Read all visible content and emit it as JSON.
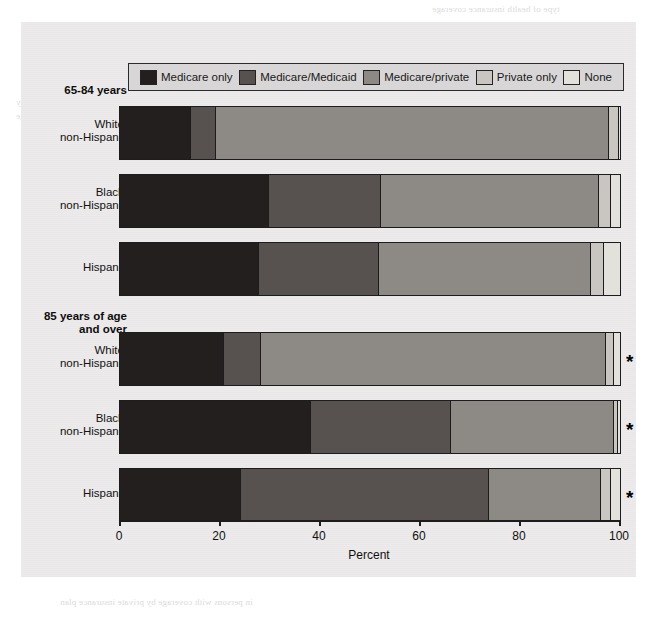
{
  "figure": {
    "axis_title": "Percent",
    "x_ticks": [
      0,
      20,
      40,
      60,
      80,
      100
    ],
    "x_min": 0,
    "x_max": 100,
    "footnote_marker": "*"
  },
  "legend": {
    "items": [
      {
        "label": "Medicare only",
        "color": "#231f1f"
      },
      {
        "label": "Medicare/Medicaid",
        "color": "#57524f"
      },
      {
        "label": "Medicare/private",
        "color": "#8d8a85"
      },
      {
        "label": "Private only",
        "color": "#c9c6c1"
      },
      {
        "label": "None",
        "color": "#e3e1dc"
      }
    ]
  },
  "groups": [
    {
      "title": "65-84 years",
      "rows": [
        {
          "label": "White,\nnon-Hispanic",
          "marker": ""
        },
        {
          "label": "Black,\nnon-Hispanic",
          "marker": ""
        },
        {
          "label": "Hispanic",
          "marker": ""
        }
      ]
    },
    {
      "title": "85 years of age\nand over",
      "rows": [
        {
          "label": "White,\nnon-Hispanic",
          "marker": "*"
        },
        {
          "label": "Black,\nnon-Hispanic",
          "marker": "*"
        },
        {
          "label": "Hispanic",
          "marker": "*"
        }
      ]
    }
  ],
  "ghost_text": [
    {
      "x": 432,
      "y": 3,
      "text": "type of health insurance coverage"
    },
    {
      "x": 470,
      "y": 28,
      "text": "Americans Medicare beneficiaries"
    },
    {
      "x": 440,
      "y": 40,
      "text": "65 Health care for the elderly insurance"
    },
    {
      "x": 170,
      "y": 28,
      "text": "Enrollment in Medicare HMO's increases"
    },
    {
      "x": 150,
      "y": 40,
      "text": "distributed throughout the country. The HMO COVID"
    },
    {
      "x": 16,
      "y": 96,
      "text": "Medicare program, they"
    },
    {
      "x": 16,
      "y": 110,
      "text": "coverage"
    },
    {
      "x": 22,
      "y": 136,
      "text": "in persons"
    },
    {
      "x": 430,
      "y": 200,
      "text": "coverage of the elderly"
    },
    {
      "x": 430,
      "y": 224,
      "text": "and 19 percent of"
    },
    {
      "x": 428,
      "y": 296,
      "text": "Medicare HMO, were"
    },
    {
      "x": 436,
      "y": 332,
      "text": "hospital insurance and"
    },
    {
      "x": 430,
      "y": 356,
      "text": "the aged and disabled"
    },
    {
      "x": 432,
      "y": 500,
      "text": "the beneficiary enrolled in HMO's in addition"
    },
    {
      "x": 452,
      "y": 520,
      "text": "health plan; in a particular choice, plan that"
    },
    {
      "x": 442,
      "y": 540,
      "text": "of HMO's among beneficiaries mobility every"
    },
    {
      "x": 60,
      "y": 596,
      "text": "in persons with coverage by private insurance plan"
    }
  ],
  "chart_data": {
    "type": "bar",
    "orientation": "horizontal",
    "stacked": true,
    "title": "",
    "xlabel": "Percent",
    "ylabel": "",
    "xlim": [
      0,
      100
    ],
    "xticks": [
      0,
      20,
      40,
      60,
      80,
      100
    ],
    "grid": false,
    "legend_position": "top",
    "categories": [
      "65-84 years: White, non-Hispanic",
      "65-84 years: Black, non-Hispanic",
      "65-84 years: Hispanic",
      "85 years of age and over: White, non-Hispanic",
      "85 years of age and over: Black, non-Hispanic",
      "85 years of age and over: Hispanic"
    ],
    "series": [
      {
        "name": "Medicare only",
        "color": "#231f1f",
        "values": [
          14.0,
          29.5,
          27.5,
          20.5,
          38.0,
          24.0
        ]
      },
      {
        "name": "Medicare/Medicaid",
        "color": "#57524f",
        "values": [
          5.0,
          22.5,
          24.0,
          7.5,
          28.0,
          49.5
        ]
      },
      {
        "name": "Medicare/private",
        "color": "#8d8a85",
        "values": [
          78.5,
          43.5,
          42.5,
          69.0,
          32.5,
          22.5
        ]
      },
      {
        "name": "Private only",
        "color": "#c9c6c1",
        "values": [
          2.0,
          2.5,
          2.5,
          1.5,
          0.8,
          2.0
        ]
      },
      {
        "name": "None",
        "color": "#e3e1dc",
        "values": [
          0.5,
          2.0,
          3.5,
          1.5,
          0.7,
          2.0
        ]
      }
    ],
    "annotations": [
      {
        "category": "85 years of age and over: White, non-Hispanic",
        "text": "*"
      },
      {
        "category": "85 years of age and over: Black, non-Hispanic",
        "text": "*"
      },
      {
        "category": "85 years of age and over: Hispanic",
        "text": "*"
      }
    ]
  },
  "layout": {
    "rows_top": [
      84,
      152,
      220,
      310,
      378,
      446
    ],
    "row_height": 52,
    "group_title_top": [
      62,
      288
    ],
    "plot_left": 98,
    "plot_width": 500
  }
}
